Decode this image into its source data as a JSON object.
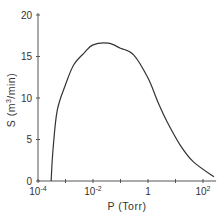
{
  "chart_data": {
    "type": "line",
    "title": "",
    "xlabel": "P (Torr)",
    "ylabel": "S (m³/min)",
    "xscale": "log",
    "xlim": [
      0.0001,
      300
    ],
    "ylim": [
      0,
      20
    ],
    "grid": false,
    "legend": null,
    "x_ticks": [
      0.0001,
      0.001,
      0.01,
      0.1,
      1,
      10,
      100
    ],
    "x_tick_labels": [
      "10⁻⁴",
      "",
      "10⁻²",
      "",
      "1",
      "",
      "10²"
    ],
    "y_ticks": [
      0,
      5,
      10,
      15,
      20
    ],
    "y_tick_labels": [
      "0",
      "5",
      "10",
      "15",
      "20"
    ],
    "series": [
      {
        "name": "pumping speed",
        "x": [
          0.0003,
          0.00035,
          0.0005,
          0.001,
          0.002,
          0.005,
          0.01,
          0.035,
          0.1,
          0.3,
          1,
          2.3,
          5,
          15,
          45,
          250
        ],
        "y": [
          0,
          3.7,
          8.5,
          11.6,
          14.0,
          15.5,
          16.4,
          16.6,
          16.0,
          15.2,
          12.4,
          9.5,
          7.1,
          4.3,
          2.3,
          0.5
        ]
      }
    ]
  },
  "axes": {
    "x_label": "P (Torr)",
    "y_label_main": "S (m",
    "y_label_sup": "3",
    "y_label_tail": "/min)",
    "y_tick_labels": [
      "0",
      "5",
      "10",
      "15",
      "20"
    ],
    "x_tick_major": [
      {
        "base": "10",
        "exp": "-4"
      },
      {
        "base": "10",
        "exp": "-2"
      },
      {
        "base": "1",
        "exp": ""
      },
      {
        "base": "10",
        "exp": "2"
      }
    ]
  }
}
